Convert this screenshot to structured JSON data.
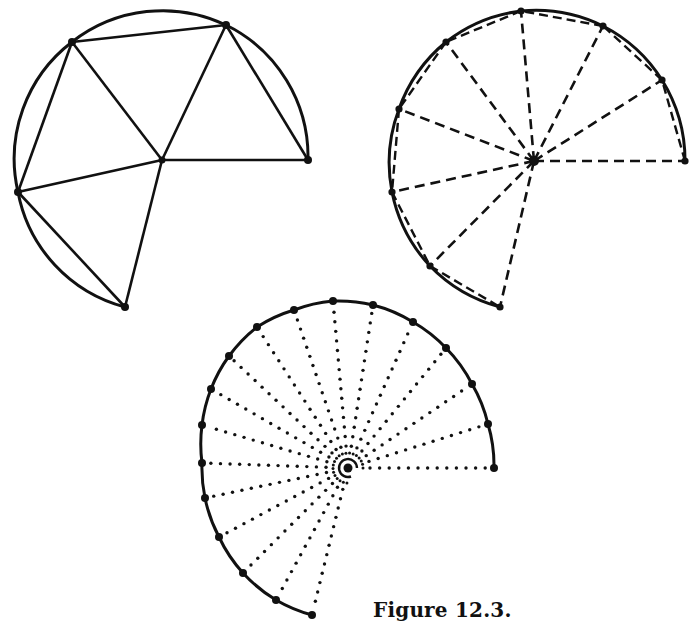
{
  "caption": "Figure 12.3.",
  "colors": {
    "ink": "#111111",
    "background": "#ffffff"
  },
  "figures": [
    {
      "id": "fig-solid",
      "style": "solid",
      "center": [
        162,
        160
      ],
      "radius": 147,
      "vertices": [
        [
          308,
          160
        ],
        [
          226,
          25
        ],
        [
          72,
          42
        ],
        [
          18,
          192
        ],
        [
          125,
          307
        ]
      ]
    },
    {
      "id": "fig-dashed",
      "style": "dashed",
      "center": [
        534,
        161
      ],
      "radius": 152,
      "vertices": [
        [
          685,
          161
        ],
        [
          662,
          80
        ],
        [
          603,
          26
        ],
        [
          521,
          11
        ],
        [
          446,
          42
        ],
        [
          399,
          109
        ],
        [
          392,
          192
        ],
        [
          430,
          266
        ],
        [
          500,
          307
        ]
      ]
    },
    {
      "id": "fig-dotted",
      "style": "dotted",
      "center": [
        348,
        468
      ],
      "radius": 146,
      "vertices": [
        [
          494,
          468
        ],
        [
          488,
          424
        ],
        [
          472,
          384
        ],
        [
          446,
          348
        ],
        [
          413,
          322
        ],
        [
          373,
          305
        ],
        [
          333,
          301
        ],
        [
          294,
          310
        ],
        [
          257,
          327
        ],
        [
          229,
          356
        ],
        [
          211,
          389
        ],
        [
          202,
          425
        ],
        [
          202,
          463
        ],
        [
          205,
          498
        ],
        [
          219,
          537
        ],
        [
          243,
          573
        ],
        [
          276,
          600
        ],
        [
          312,
          615
        ]
      ]
    }
  ]
}
